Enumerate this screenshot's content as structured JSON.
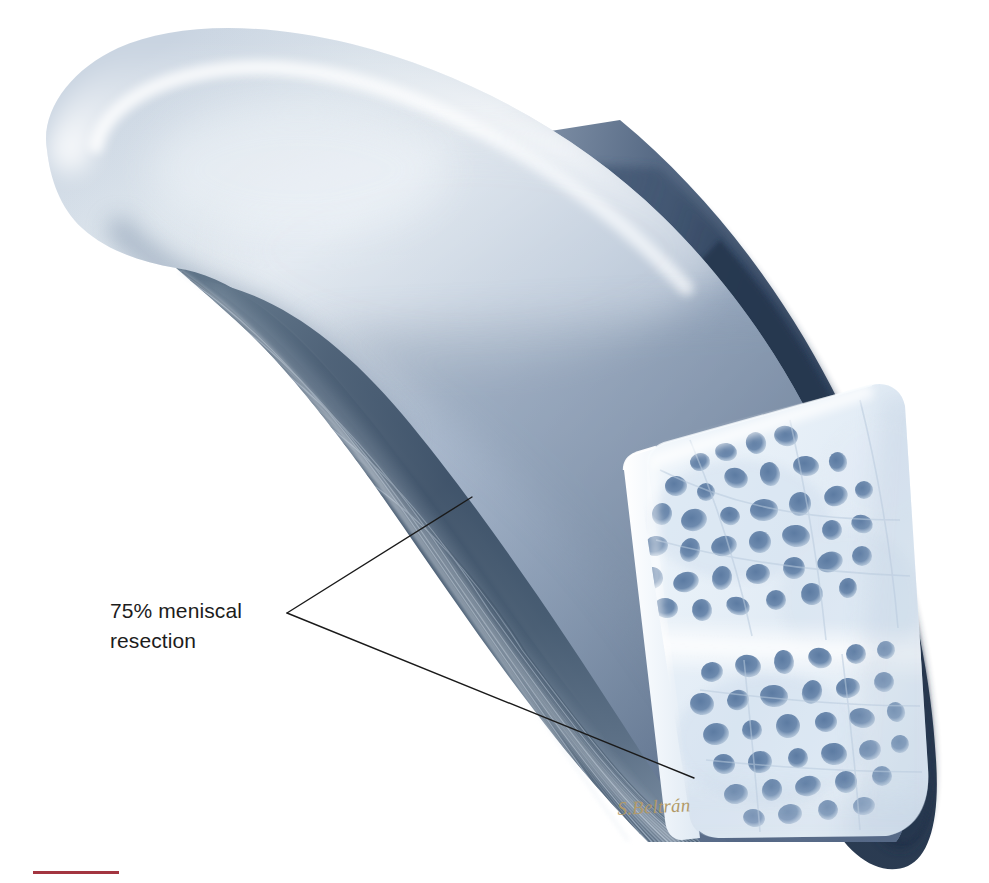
{
  "figure": {
    "title": "75% meniscal resection",
    "width": 989,
    "height": 883,
    "background_color": "#ffffff"
  },
  "callout": {
    "label": "75% meniscal resection",
    "line1": "75% meniscal",
    "line2": "resection",
    "text_color": "#1c1c1c",
    "font_size_px": 21,
    "leader": {
      "vertex": [
        287,
        613
      ],
      "upper_endpoint": [
        472,
        497
      ],
      "lower_endpoint": [
        694,
        778
      ],
      "stroke_color": "#1a1a1a",
      "stroke_width": 1.4
    }
  },
  "signature": {
    "text": "S.Beltrán",
    "color": "#b29a68",
    "style": "italic script"
  },
  "bottom_rule": {
    "color": "#a33540",
    "x": 33,
    "y": 871,
    "width": 86,
    "height": 3
  },
  "palette": {
    "meniscus_highlight": "#e9eef4",
    "meniscus_light": "#c3cedd",
    "meniscus_mid": "#96a8bf",
    "meniscus_dark": "#6f8299",
    "fibrous_dark": "#45596f",
    "fibrous_darker": "#33455a",
    "shadow_navy": "#2b3f5b",
    "shadow_navy_deep": "#22344d",
    "bone_pale": "#eef4fa",
    "bone_white": "#f8fbfe",
    "bone_lacunae": "#6e8bad",
    "bone_lacunae_dark": "#5a7a9e",
    "paper_white": "#ffffff"
  },
  "regions": [
    {
      "name": "meniscus-superior-surface",
      "description": "smooth convex blue-grey upper body of meniscus with specular highlight band"
    },
    {
      "name": "meniscus-anterior-horn",
      "description": "rounded tapering tip at upper left"
    },
    {
      "name": "resected-fibrous-surface",
      "description": "dark striated cut face showing circumferential collagen fibres"
    },
    {
      "name": "bone-cross-section",
      "description": "pale trabecular bone block with blue lacunae spots in two bands"
    },
    {
      "name": "posterior-shadow",
      "description": "deep navy cast shadow along right convex margin"
    }
  ]
}
